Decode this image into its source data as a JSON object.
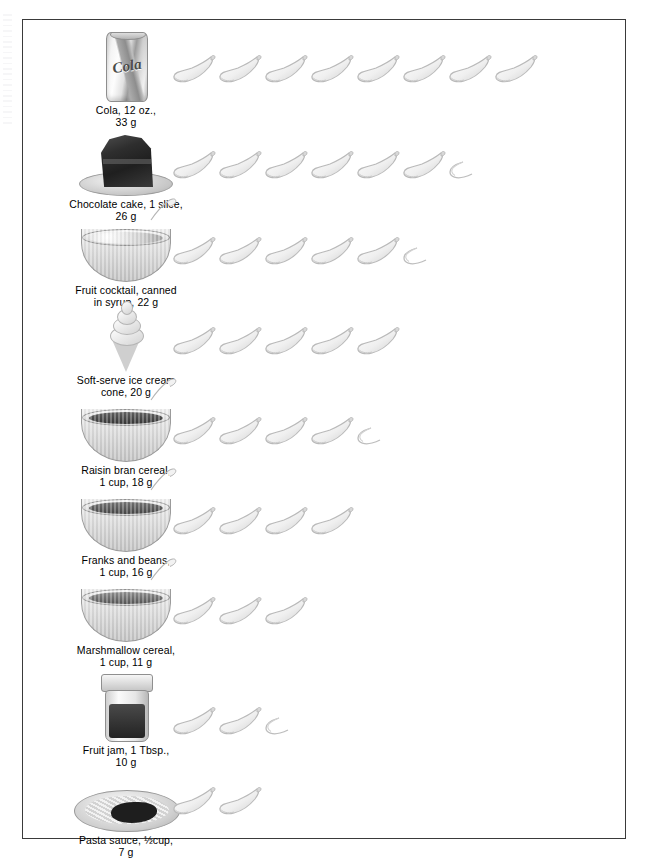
{
  "figure": {
    "unit_label": "teaspoon",
    "icon_name": "teaspoon-icon",
    "border_color": "#3a3a3a",
    "background_color": "#ffffff"
  },
  "chart_data": {
    "type": "bar",
    "xlabel": "Teaspoons of sugar",
    "ylabel": "",
    "categories": [
      "Cola, 12 oz.",
      "Chocolate cake, 1 slice",
      "Fruit cocktail, canned in syrup",
      "Soft-serve ice cream cone",
      "Raisin bran cereal, 1 cup",
      "Franks and beans, 1 cup",
      "Marshmallow cereal, 1 cup",
      "Fruit jam, 1 Tbsp.",
      "Pasta sauce, ½ cup"
    ],
    "values": [
      8,
      6.5,
      5.5,
      5,
      4.5,
      4,
      3,
      2.5,
      2
    ],
    "grams": [
      33,
      26,
      22,
      20,
      18,
      16,
      11,
      10,
      7
    ],
    "value_units": "teaspoons",
    "xlim": [
      0,
      8
    ],
    "grid": false,
    "legend": "none"
  },
  "rows": [
    {
      "id": "cola",
      "art": "cola-can",
      "art_text": "Cola",
      "caption": "Cola, 12 oz.,\n33 g",
      "food_name": "Cola, 12 oz.",
      "grams": "33 g",
      "spoons_full": 8,
      "spoons_half": 0,
      "teaspoons": 8
    },
    {
      "id": "chocolate-cake",
      "art": "cake-slice",
      "art_text": "",
      "caption": "Chocolate cake, 1 slice,\n26 g",
      "food_name": "Chocolate cake, 1 slice",
      "grams": "26 g",
      "spoons_full": 6,
      "spoons_half": 1,
      "teaspoons": 6.5
    },
    {
      "id": "fruit-cocktail",
      "art": "bowl-fruit",
      "art_text": "",
      "caption": "Fruit cocktail, canned\nin syrup, 22 g",
      "food_name": "Fruit cocktail, canned in syrup",
      "grams": "22 g",
      "spoons_full": 5,
      "spoons_half": 1,
      "teaspoons": 5.5
    },
    {
      "id": "soft-serve",
      "art": "ice-cream-cone",
      "art_text": "",
      "caption": "Soft-serve ice cream\ncone, 20 g",
      "food_name": "Soft-serve ice cream cone",
      "grams": "20 g",
      "spoons_full": 5,
      "spoons_half": 0,
      "teaspoons": 5
    },
    {
      "id": "raisin-bran",
      "art": "bowl-bran",
      "art_text": "",
      "caption": "Raisin bran cereal,\n1 cup, 18 g",
      "food_name": "Raisin bran cereal, 1 cup",
      "grams": "18 g",
      "spoons_full": 4,
      "spoons_half": 1,
      "teaspoons": 4.5
    },
    {
      "id": "franks-and-beans",
      "art": "bowl-beans",
      "art_text": "",
      "caption": "Franks and beans,\n1 cup, 16 g",
      "food_name": "Franks and beans, 1 cup",
      "grams": "16 g",
      "spoons_full": 4,
      "spoons_half": 0,
      "teaspoons": 4
    },
    {
      "id": "marshmallow-cereal",
      "art": "bowl-marsh",
      "art_text": "",
      "caption": "Marshmallow cereal,\n1 cup, 11 g",
      "food_name": "Marshmallow cereal, 1 cup",
      "grams": "11 g",
      "spoons_full": 3,
      "spoons_half": 0,
      "teaspoons": 3
    },
    {
      "id": "fruit-jam",
      "art": "jam-jar",
      "art_text": "",
      "caption": "Fruit jam, 1 Tbsp.,\n10 g",
      "food_name": "Fruit jam, 1 Tbsp.",
      "grams": "10 g",
      "spoons_full": 2,
      "spoons_half": 1,
      "teaspoons": 2.5
    },
    {
      "id": "pasta-sauce",
      "art": "pasta-plate",
      "art_text": "",
      "caption": "Pasta sauce, ½cup,\n7 g",
      "food_name": "Pasta sauce, ½ cup",
      "grams": "7 g",
      "spoons_full": 2,
      "spoons_half": 0,
      "teaspoons": 2
    }
  ]
}
